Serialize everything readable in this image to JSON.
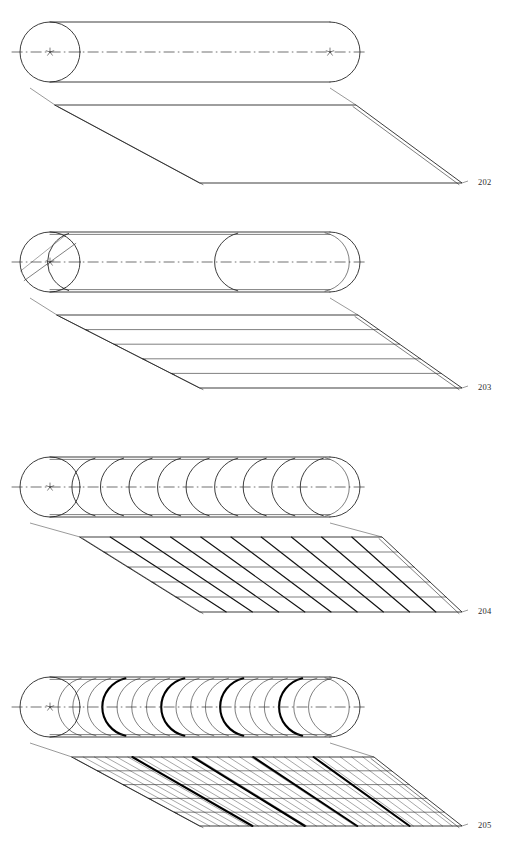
{
  "document": {
    "kind": "patent-figure-sheet",
    "title": "Roll winding progression figures",
    "background_color": "#ffffff",
    "ink_color": "#1a1a1a",
    "width": 510,
    "height": 843
  },
  "figures": [
    {
      "id": "fig-202",
      "reference_numeral": "202",
      "caption": "",
      "label_x": 478,
      "label_y": 183,
      "stage_index": 1,
      "description": "Cylindrical roll with a single plain unwound web; sheet is blank with no wrap lines",
      "roll": {
        "center_x": 50,
        "center_y": 52,
        "radius": 30,
        "right_x": 330,
        "arc_count": 0,
        "bold_arc_every": 0,
        "has_center_mark": true,
        "has_axis_line": true,
        "has_diagonal_seam": false,
        "end_marks": 2
      },
      "web": {
        "top_left_x": 30,
        "top_left_y": 88,
        "top_right_x": 330,
        "top_right_y": 88,
        "fold_left_x": 55,
        "fold_left_y": 105,
        "fold_right_x": 356,
        "fold_right_y": 105,
        "bottom_left_x": 200,
        "bottom_left_y": 183,
        "bottom_right_x": 462,
        "bottom_right_y": 183,
        "horizontal_lines": 0,
        "diagonal_lines": 0,
        "bold_diagonals": 0,
        "hair_diagonals": 0
      }
    },
    {
      "id": "fig-203",
      "reference_numeral": "203",
      "caption": "",
      "label_x": 478,
      "label_y": 388,
      "stage_index": 2,
      "description": "Roll with one helical wrap; web shows four transverse division lines",
      "roll": {
        "center_x": 50,
        "center_y": 262,
        "radius": 30,
        "right_x": 330,
        "arc_count": 1,
        "bold_arc_every": 0,
        "has_center_mark": true,
        "has_axis_line": true,
        "has_diagonal_seam": true,
        "end_marks": 1
      },
      "web": {
        "top_left_x": 30,
        "top_left_y": 298,
        "top_right_x": 330,
        "top_right_y": 298,
        "fold_left_x": 57,
        "fold_left_y": 315,
        "fold_right_x": 358,
        "fold_right_y": 315,
        "bottom_left_x": 200,
        "bottom_left_y": 388,
        "bottom_right_x": 462,
        "bottom_right_y": 388,
        "horizontal_lines": 4,
        "diagonal_lines": 0,
        "bold_diagonals": 0,
        "hair_diagonals": 0
      }
    },
    {
      "id": "fig-204",
      "reference_numeral": "204",
      "caption": "",
      "label_x": 478,
      "label_y": 612,
      "stage_index": 3,
      "description": "Roll with nine overlapping wraps; web shows a grid of transverse and diagonal lines",
      "roll": {
        "center_x": 50,
        "center_y": 487,
        "radius": 30,
        "right_x": 330,
        "arc_count": 9,
        "bold_arc_every": 0,
        "has_center_mark": true,
        "has_axis_line": true,
        "has_diagonal_seam": false,
        "end_marks": 1
      },
      "web": {
        "top_left_x": 30,
        "top_left_y": 523,
        "top_right_x": 330,
        "top_right_y": 523,
        "fold_left_x": 80,
        "fold_left_y": 537,
        "fold_right_x": 382,
        "fold_right_y": 537,
        "bottom_left_x": 200,
        "bottom_left_y": 612,
        "bottom_right_x": 462,
        "bottom_right_y": 612,
        "horizontal_lines": 4,
        "diagonal_lines": 9,
        "bold_diagonals": 0,
        "hair_diagonals": 0
      }
    },
    {
      "id": "fig-205",
      "reference_numeral": "205",
      "caption": "",
      "label_x": 478,
      "label_y": 826,
      "stage_index": 4,
      "description": "Roll with eighteen dense wraps, every fourth emphasised; web shows fine diagonal hatching with four bold diagonals",
      "roll": {
        "center_x": 50,
        "center_y": 707,
        "radius": 30,
        "right_x": 330,
        "arc_count": 18,
        "bold_arc_every": 4,
        "has_center_mark": true,
        "has_axis_line": true,
        "has_diagonal_seam": false,
        "end_marks": 1
      },
      "web": {
        "top_left_x": 30,
        "top_left_y": 743,
        "top_right_x": 330,
        "top_right_y": 743,
        "fold_left_x": 72,
        "fold_left_y": 757,
        "fold_right_x": 374,
        "fold_right_y": 757,
        "bottom_left_x": 200,
        "bottom_left_y": 826,
        "bottom_right_x": 462,
        "bottom_right_y": 826,
        "horizontal_lines": 4,
        "diagonal_lines": 0,
        "bold_diagonals": 4,
        "hair_diagonals": 26
      }
    }
  ]
}
